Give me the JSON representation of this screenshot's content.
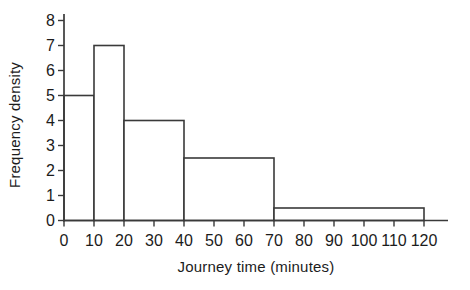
{
  "page": {
    "background": "#ffffff"
  },
  "chart_data": {
    "type": "bar",
    "kind": "histogram",
    "title": "",
    "xlabel": "Journey time (minutes)",
    "ylabel": "Frequency density",
    "xlim": [
      0,
      120
    ],
    "ylim": [
      0,
      8
    ],
    "x_ticks": [
      0,
      10,
      20,
      30,
      40,
      50,
      60,
      70,
      80,
      90,
      100,
      110,
      120
    ],
    "y_ticks": [
      0,
      1,
      2,
      3,
      4,
      5,
      6,
      7,
      8
    ],
    "grid": false,
    "legend": false,
    "bins": [
      {
        "from": 0,
        "to": 10,
        "frequency_density": 5
      },
      {
        "from": 10,
        "to": 20,
        "frequency_density": 7
      },
      {
        "from": 20,
        "to": 40,
        "frequency_density": 4
      },
      {
        "from": 40,
        "to": 70,
        "frequency_density": 2.5
      },
      {
        "from": 70,
        "to": 120,
        "frequency_density": 0.5
      }
    ],
    "colors": {
      "bar_fill": "#ffffff",
      "line": "#3a3a3a",
      "text": "#1c1c1c"
    }
  }
}
